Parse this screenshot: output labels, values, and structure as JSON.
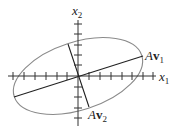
{
  "diagram": {
    "type": "ellipse-with-principal-axes",
    "axes": {
      "x_label": "x",
      "x_sub": "1",
      "y_label": "x",
      "y_sub": "2"
    },
    "vectors": [
      {
        "name": "A",
        "vec": "v",
        "sub": "1"
      },
      {
        "name": "A",
        "vec": "v",
        "sub": "2"
      }
    ],
    "colors": {
      "ellipse": "#8a8a8a",
      "axes": "#333333",
      "vectors": "#222222"
    }
  }
}
